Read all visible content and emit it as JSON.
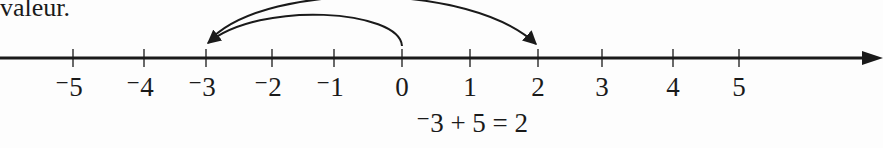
{
  "header_text": "valeur.",
  "number_line": {
    "ticks": [
      {
        "value": -5,
        "label": "⁻5",
        "x": 73
      },
      {
        "value": -4,
        "label": "⁻4",
        "x": 144
      },
      {
        "value": -3,
        "label": "⁻3",
        "x": 206
      },
      {
        "value": -2,
        "label": "⁻2",
        "x": 272
      },
      {
        "value": -1,
        "label": "⁻1",
        "x": 334
      },
      {
        "value": 0,
        "label": "0",
        "x": 402
      },
      {
        "value": 1,
        "label": "1",
        "x": 470
      },
      {
        "value": 2,
        "label": "2",
        "x": 538
      },
      {
        "value": 3,
        "label": "3",
        "x": 602
      },
      {
        "value": 4,
        "label": "4",
        "x": 673
      },
      {
        "value": 5,
        "label": "5",
        "x": 739
      }
    ],
    "arrows": [
      {
        "from": 0,
        "to": -3,
        "meaning": "start at -3"
      },
      {
        "from": -3,
        "to": 2,
        "meaning": "add +5"
      }
    ],
    "line_color": "#1a1a1a"
  },
  "equation": "⁻3 + 5 = 2"
}
